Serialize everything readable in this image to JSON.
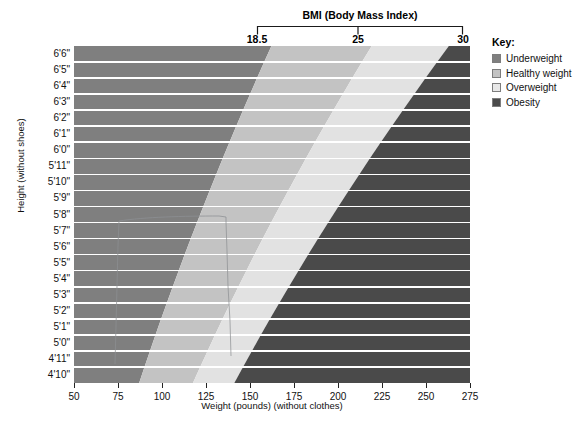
{
  "chart_data": {
    "type": "heatmap",
    "title": "BMI (Body Mass Index)",
    "xlabel": "Weight (pounds) (without clothes)",
    "ylabel": "Height (without shoes)",
    "xlim": [
      50,
      275
    ],
    "ylim_heights_inches": [
      58,
      78
    ],
    "x_ticks": [
      50,
      75,
      100,
      125,
      150,
      175,
      200,
      225,
      250,
      275
    ],
    "x_tick_labels": [
      "50",
      "75",
      "100",
      "125",
      "150",
      "175",
      "200",
      "225",
      "250",
      "275"
    ],
    "y_tick_labels": [
      "6'6\"",
      "6'5\"",
      "6'4\"",
      "6'3\"",
      "6'2\"",
      "6'1\"",
      "6'0\"",
      "5'11\"",
      "5'10\"",
      "5'9\"",
      "5'8\"",
      "5'7\"",
      "5'6\"",
      "5'5\"",
      "5'4\"",
      "5'3\"",
      "5'2\"",
      "5'1\"",
      "5'0\"",
      "4'11\"",
      "4'10\""
    ],
    "bmi_axis": {
      "label": "BMI (Body Mass Index)",
      "ticks": [
        18.5,
        25,
        30
      ],
      "tick_labels": [
        "18.5",
        "25",
        "30"
      ]
    },
    "categories": [
      "Underweight",
      "Healthy weight",
      "Overweight",
      "Obesity"
    ],
    "bmi_ranges": [
      {
        "name": "Underweight",
        "min": 0,
        "max": 18.5,
        "color": "#7f7f7f"
      },
      {
        "name": "Healthy weight",
        "min": 18.5,
        "max": 25,
        "color": "#c3c3c3"
      },
      {
        "name": "Overweight",
        "min": 25,
        "max": 30,
        "color": "#e2e2e2"
      },
      {
        "name": "Obesity",
        "min": 30,
        "max": 100,
        "color": "#4a4a4a"
      }
    ],
    "grid": true,
    "legend_position": "right"
  },
  "header": {
    "bmi_title": "BMI (Body Mass Index)",
    "bmi_tick_1": "18.5",
    "bmi_tick_2": "25",
    "bmi_tick_3": "30"
  },
  "axes": {
    "y_title": "Height (without shoes)",
    "x_title": "Weight (pounds) (without clothes)"
  },
  "legend": {
    "title": "Key:",
    "items": [
      {
        "label": "Underweight",
        "color": "#7f7f7f"
      },
      {
        "label": "Healthy weight",
        "color": "#c3c3c3"
      },
      {
        "label": "Overweight",
        "color": "#e8e8e8"
      },
      {
        "label": "Obesity",
        "color": "#4a4a4a"
      }
    ]
  },
  "colors": {
    "underweight": "#7f7f7f",
    "healthy": "#c3c3c3",
    "overweight": "#e2e2e2",
    "obesity": "#4a4a4a",
    "separator": "#ffffff",
    "text": "#111111"
  }
}
